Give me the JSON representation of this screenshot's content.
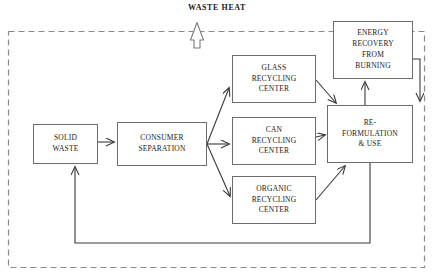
{
  "diagram": {
    "title": "WASTE HEAT",
    "boundary": {
      "name": "system-boundary",
      "style": "dashed",
      "color": "#8a8a8a",
      "x": 8,
      "y": 31,
      "width": 417,
      "height": 237
    },
    "nodes": [
      {
        "id": "solid-waste",
        "label": "SOLID\nWASTE",
        "x": 33,
        "y": 124,
        "width": 65,
        "height": 40
      },
      {
        "id": "consumer-separation",
        "label": "CONSUMER\nSEPARATION",
        "x": 117,
        "y": 122,
        "width": 90,
        "height": 44
      },
      {
        "id": "glass-recycling-center",
        "label": "GLASS\nRECYCLING\nCENTER",
        "x": 232,
        "y": 55,
        "width": 84,
        "height": 48
      },
      {
        "id": "can-recycling-center",
        "label": "CAN\nRECYCLING\nCENTER",
        "x": 232,
        "y": 117,
        "width": 84,
        "height": 48
      },
      {
        "id": "organic-recycling-center",
        "label": "ORGANIC\nRECYCLING\nCENTER",
        "x": 232,
        "y": 176,
        "width": 84,
        "height": 48
      },
      {
        "id": "energy-recovery-from-burning",
        "label": "ENERGY\nRECOVERY\nFROM\nBURNING",
        "x": 333,
        "y": 21,
        "width": 80,
        "height": 58
      },
      {
        "id": "re-formulation-and-use",
        "label": "RE-\nFORMULATION\n& USE",
        "x": 327,
        "y": 105,
        "width": 86,
        "height": 58
      }
    ],
    "connections": [
      {
        "id": "solid-waste-to-consumer-separation",
        "from": "solid-waste",
        "to": "consumer-separation"
      },
      {
        "id": "consumer-separation-to-glass",
        "from": "consumer-separation",
        "to": "glass-recycling-center"
      },
      {
        "id": "consumer-separation-to-can",
        "from": "consumer-separation",
        "to": "can-recycling-center"
      },
      {
        "id": "consumer-separation-to-organic",
        "from": "consumer-separation",
        "to": "organic-recycling-center"
      },
      {
        "id": "glass-to-re-formulation",
        "from": "glass-recycling-center",
        "to": "re-formulation-and-use"
      },
      {
        "id": "can-to-re-formulation",
        "from": "can-recycling-center",
        "to": "re-formulation-and-use"
      },
      {
        "id": "organic-to-re-formulation",
        "from": "organic-recycling-center",
        "to": "re-formulation-and-use"
      },
      {
        "id": "re-formulation-to-energy-recovery",
        "from": "re-formulation-and-use",
        "to": "energy-recovery-from-burning"
      },
      {
        "id": "energy-recovery-to-re-formulation",
        "from": "energy-recovery-from-burning",
        "to": "re-formulation-and-use"
      },
      {
        "id": "re-formulation-to-solid-waste-feedback",
        "from": "re-formulation-and-use",
        "to": "solid-waste"
      },
      {
        "id": "energy-recovery-to-waste-heat",
        "from": "energy-recovery-from-burning",
        "to": "waste-heat"
      }
    ],
    "colors": {
      "box_border": "#6d6d6d",
      "connector": "#3a3a3a",
      "boundary": "#8a8a8a",
      "text": "#1a1a1a",
      "background": "#ffffff"
    }
  }
}
